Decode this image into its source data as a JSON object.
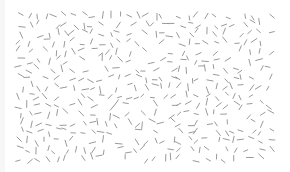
{
  "canvas": {
    "width": 290,
    "height": 172,
    "background": "#ffffff",
    "left_band_color": "#f7f7f7",
    "left_band_width": 5
  },
  "field": {
    "description": "Random-orientation line segment texture",
    "area": {
      "x": 16,
      "y": 11,
      "width": 258,
      "height": 152
    },
    "grid_cols": 29,
    "grid_rows": 17,
    "segment_length_min": 4,
    "segment_length_max": 7,
    "segment_width": 1,
    "segment_color": "#9a9a9a",
    "jitter": 3.2,
    "skip_probability": 0.18,
    "seed": 1337
  }
}
